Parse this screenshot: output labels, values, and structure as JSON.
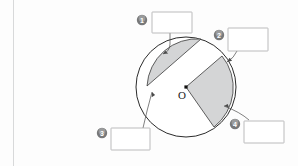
{
  "page": {
    "background_color": "#fdfdfd",
    "width": 298,
    "height": 166
  },
  "diagram": {
    "name": "circle-parts-labeling",
    "center_label": "O",
    "circle": {
      "cx": 186,
      "cy": 87,
      "r": 50,
      "stroke_color": "#2b2b2b",
      "fill_color": "#ffffff"
    },
    "shaded_color": "#d4d5d6",
    "regions": [
      {
        "name": "circle-segment-top-left",
        "type": "segment",
        "shaded": true
      },
      {
        "name": "circle-sector-right",
        "type": "sector",
        "shaded": true
      }
    ]
  },
  "markers": [
    {
      "id": 1,
      "number": "1",
      "answer_value": "",
      "answer_placeholder": "",
      "marker_x": 142,
      "marker_y": 20,
      "box_x": 152,
      "box_y": 12,
      "box_w": 40,
      "box_h": 21
    },
    {
      "id": 2,
      "number": "2",
      "answer_value": "",
      "answer_placeholder": "",
      "marker_x": 219,
      "marker_y": 35,
      "box_x": 228,
      "box_y": 28,
      "box_w": 40,
      "box_h": 23
    },
    {
      "id": 3,
      "number": "3",
      "answer_value": "",
      "answer_placeholder": "",
      "marker_x": 102,
      "marker_y": 133,
      "box_x": 111,
      "box_y": 128,
      "box_w": 39,
      "box_h": 22
    },
    {
      "id": 4,
      "number": "4",
      "answer_value": "",
      "answer_placeholder": "",
      "marker_x": 235,
      "marker_y": 124,
      "box_x": 244,
      "box_y": 121,
      "box_w": 40,
      "box_h": 22
    }
  ],
  "colors": {
    "marker_disc": "#777879",
    "box_border": "#aaaaab",
    "leader_line": "#4a4a4a",
    "circle_stroke": "#2b2b2b",
    "shade_fill": "#d4d5d6"
  }
}
